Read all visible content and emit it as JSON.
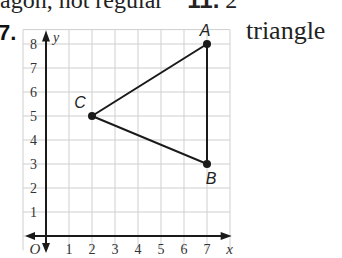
{
  "header_fragment": {
    "text": "agon, not regular",
    "next_num": "11.",
    "next_text": "2"
  },
  "problem": {
    "number": "7.",
    "answer_word": "triangle"
  },
  "graph": {
    "x_axis_label": "x",
    "y_axis_label": "y",
    "origin_label": "O",
    "x_ticks": [
      "1",
      "2",
      "3",
      "4",
      "5",
      "6",
      "7"
    ],
    "y_ticks": [
      "1",
      "2",
      "3",
      "4",
      "5",
      "6",
      "7",
      "8"
    ],
    "points": [
      {
        "label": "A",
        "x": 7,
        "y": 8
      },
      {
        "label": "B",
        "x": 7,
        "y": 3
      },
      {
        "label": "C",
        "x": 2,
        "y": 5
      }
    ],
    "colors": {
      "grid": "#cfcfcf",
      "axis": "#1a1a1a",
      "segment": "#1a1a1a"
    }
  }
}
